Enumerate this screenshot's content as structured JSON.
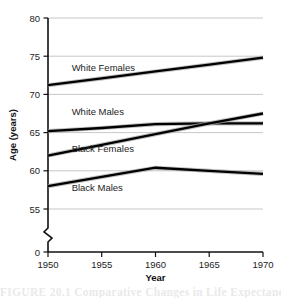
{
  "chart_data": {
    "type": "line",
    "title": "",
    "xlabel": "Year",
    "ylabel": "Age (years)",
    "x": [
      1950,
      1955,
      1960,
      1965,
      1970
    ],
    "xlim": [
      1950,
      1970
    ],
    "ylim": [
      55,
      80
    ],
    "y_axis_broken": true,
    "y_break_bottom_label": "0",
    "grid": true,
    "legend_position": "inline-labels",
    "xticks": [
      "1950",
      "1955",
      "1960",
      "1965",
      "1970"
    ],
    "yticks": [
      "55",
      "60",
      "65",
      "70",
      "75",
      "80"
    ],
    "series": [
      {
        "name": "White Females",
        "label": "White Females",
        "values": [
          71.2,
          72.1,
          73.0,
          73.9,
          74.8
        ],
        "label_x": 1952.2,
        "label_y": 73.1
      },
      {
        "name": "White Males",
        "label": "White Males",
        "values": [
          65.2,
          65.6,
          66.1,
          66.2,
          66.2
        ],
        "label_x": 1952.2,
        "label_y": 67.3
      },
      {
        "name": "Black Females",
        "label": "Black Females",
        "values": [
          62.0,
          63.4,
          64.8,
          66.2,
          67.5
        ],
        "label_x": 1952.2,
        "label_y": 62.5
      },
      {
        "name": "Black Males",
        "label": "Black Males",
        "values": [
          58.0,
          59.2,
          60.4,
          60.0,
          59.6
        ],
        "label_x": 1952.2,
        "label_y": 57.4
      }
    ]
  },
  "caption": {
    "text": "FIGURE 20.1  Comparative Changes in Life Expectancy"
  }
}
